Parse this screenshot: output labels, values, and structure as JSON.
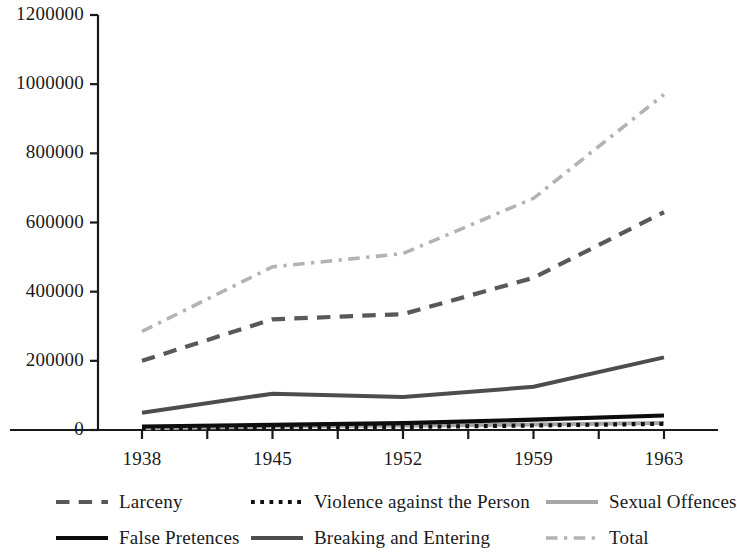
{
  "chart_data": {
    "type": "line",
    "title": "",
    "subtitle": "",
    "xlabel": "",
    "ylabel": "",
    "x": [
      1938,
      1945,
      1952,
      1959,
      1963
    ],
    "xtick_labels": [
      "1938",
      "1945",
      "1952",
      "1959",
      "1963"
    ],
    "ytick_labels": [
      "0",
      "200000",
      "400000",
      "600000",
      "800000",
      "1000000",
      "1200000"
    ],
    "ytick_values": [
      0,
      200000,
      400000,
      600000,
      800000,
      1000000,
      1200000
    ],
    "ylim": [
      0,
      1200000
    ],
    "xlim": [
      1938,
      1963
    ],
    "grid": false,
    "legend_position": "bottom",
    "series": [
      {
        "name": "Larceny",
        "values": [
          200000,
          320000,
          335000,
          440000,
          630000
        ],
        "style": "dashed",
        "color": "#595959"
      },
      {
        "name": "Violence against the Person",
        "values": [
          3000,
          8000,
          9000,
          13000,
          18000
        ],
        "style": "dotted",
        "color": "#111111"
      },
      {
        "name": "Sexual Offences",
        "values": [
          5000,
          10000,
          13000,
          16000,
          20000
        ],
        "style": "solid",
        "color": "#a6a6a6"
      },
      {
        "name": "False Pretences",
        "values": [
          10000,
          15000,
          20000,
          30000,
          42000
        ],
        "style": "solid",
        "color": "#0d0d0d"
      },
      {
        "name": "Breaking and Entering",
        "values": [
          50000,
          105000,
          95000,
          125000,
          210000
        ],
        "style": "solid",
        "color": "#4d4d4d"
      },
      {
        "name": "Total",
        "values": [
          285000,
          472000,
          510000,
          670000,
          970000
        ],
        "style": "dash-dot",
        "color": "#b3b3b3"
      }
    ]
  },
  "legend": {
    "items": [
      {
        "label": "Larceny",
        "series": "Larceny"
      },
      {
        "label": "Violence against the Person",
        "series": "Violence against the Person"
      },
      {
        "label": "Sexual Offences",
        "series": "Sexual Offences"
      },
      {
        "label": "False Pretences",
        "series": "False Pretences"
      },
      {
        "label": "Breaking and Entering",
        "series": "Breaking and Entering"
      },
      {
        "label": "Total",
        "series": "Total"
      }
    ]
  },
  "axes": {
    "axis_color": "#1a1a1a",
    "minor_ticks_per_interval": 1
  }
}
